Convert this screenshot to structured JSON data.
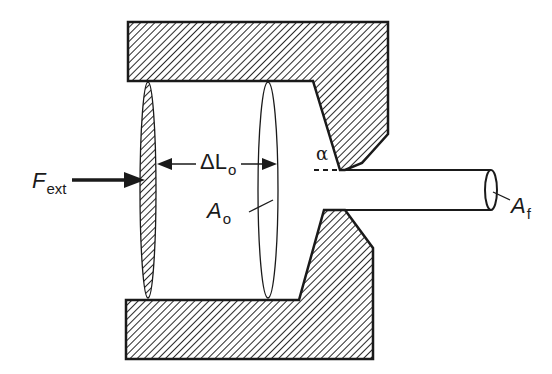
{
  "diagram": {
    "colors": {
      "stroke": "#1a1a1a",
      "hatch": "#2a2a2a",
      "background": "#ffffff"
    },
    "components": {
      "die_top": "die-upper-block",
      "die_bottom": "die-lower-block",
      "ram": "ram-piston",
      "billet_face": "billet-cross-section",
      "extrudate": "extruded-rod",
      "extrudate_face": "extruded-rod-cross-section"
    },
    "labels": {
      "force": {
        "main": "F",
        "sub": "ext"
      },
      "length": {
        "main": "ΔL",
        "sub": "o"
      },
      "initial_area": {
        "main": "A",
        "sub": "o"
      },
      "final_area": {
        "main": "A",
        "sub": "f"
      },
      "die_angle": {
        "main": "α"
      }
    }
  }
}
